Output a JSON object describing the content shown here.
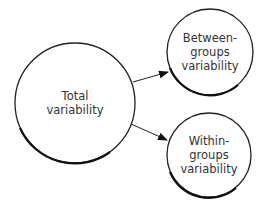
{
  "diagram": {
    "nodes": [
      {
        "id": "total",
        "label": "Total\nvariability"
      },
      {
        "id": "between",
        "label": "Between-\ngroups\nvariability"
      },
      {
        "id": "within",
        "label": "Within-\ngroups\nvariability"
      }
    ],
    "edges": [
      {
        "from": "total",
        "to": "between"
      },
      {
        "from": "total",
        "to": "within"
      }
    ]
  }
}
